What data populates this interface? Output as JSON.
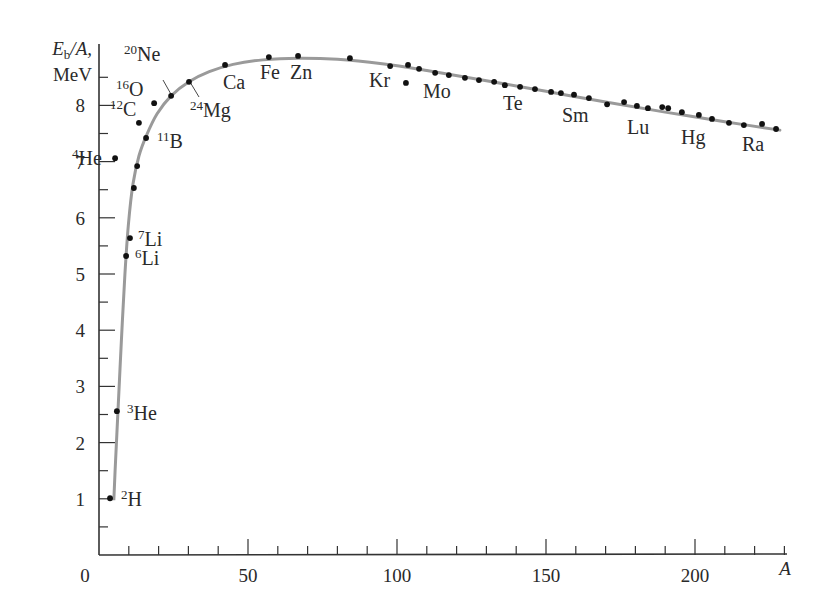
{
  "chart_data": {
    "type": "scatter",
    "title": "",
    "xlabel": "A",
    "ylabel_line1": "E_b/A,",
    "ylabel_line2": "MeV",
    "xlim": [
      0,
      230
    ],
    "ylim": [
      0,
      9.2
    ],
    "grid": false,
    "legend": null,
    "x_ticks": [
      0,
      50,
      100,
      150,
      200
    ],
    "x_tick_labels": [
      "0",
      "50",
      "100",
      "150",
      "200"
    ],
    "x_minor_step": 10,
    "y_ticks": [
      1,
      2,
      3,
      4,
      5,
      6,
      7,
      8
    ],
    "y_tick_labels": [
      "1",
      "2",
      "3",
      "4",
      "5",
      "6",
      "7",
      "8"
    ],
    "y_minor_step": 0.5,
    "colors": {
      "curve": "#9a9a9a",
      "points": "#111111",
      "axis": "#333333",
      "text": "#2a2a2a"
    },
    "series": [
      {
        "name": "Measured binding energy per nucleon",
        "kind": "points",
        "points": [
          {
            "A": 3.7,
            "E": 1.01
          },
          {
            "A": 6.0,
            "E": 2.56
          },
          {
            "A": 9.1,
            "E": 5.32
          },
          {
            "A": 10.4,
            "E": 5.64
          },
          {
            "A": 11.7,
            "E": 6.53
          },
          {
            "A": 12.8,
            "E": 6.92
          },
          {
            "A": 5.4,
            "E": 7.06
          },
          {
            "A": 15.8,
            "E": 7.42
          },
          {
            "A": 13.4,
            "E": 7.69
          },
          {
            "A": 18.5,
            "E": 8.04
          },
          {
            "A": 24.2,
            "E": 8.17
          },
          {
            "A": 30.2,
            "E": 8.42
          },
          {
            "A": 42.3,
            "E": 8.72
          },
          {
            "A": 57.0,
            "E": 8.86
          },
          {
            "A": 66.8,
            "E": 8.88
          },
          {
            "A": 84.2,
            "E": 8.84
          },
          {
            "A": 97.7,
            "E": 8.7
          },
          {
            "A": 103.0,
            "E": 8.4
          },
          {
            "A": 103.7,
            "E": 8.72
          },
          {
            "A": 107.4,
            "E": 8.65
          },
          {
            "A": 112.8,
            "E": 8.58
          },
          {
            "A": 117.4,
            "E": 8.54
          },
          {
            "A": 122.8,
            "E": 8.49
          },
          {
            "A": 127.5,
            "E": 8.45
          },
          {
            "A": 132.6,
            "E": 8.42
          },
          {
            "A": 136.2,
            "E": 8.36
          },
          {
            "A": 141.3,
            "E": 8.33
          },
          {
            "A": 146.3,
            "E": 8.29
          },
          {
            "A": 151.7,
            "E": 8.24
          },
          {
            "A": 155.0,
            "E": 8.22
          },
          {
            "A": 159.4,
            "E": 8.19
          },
          {
            "A": 164.4,
            "E": 8.13
          },
          {
            "A": 170.5,
            "E": 8.02
          },
          {
            "A": 176.2,
            "E": 8.06
          },
          {
            "A": 180.5,
            "E": 7.99
          },
          {
            "A": 184.2,
            "E": 7.95
          },
          {
            "A": 189.0,
            "E": 7.97
          },
          {
            "A": 191.0,
            "E": 7.95
          },
          {
            "A": 195.6,
            "E": 7.88
          },
          {
            "A": 201.3,
            "E": 7.83
          },
          {
            "A": 205.7,
            "E": 7.76
          },
          {
            "A": 211.4,
            "E": 7.69
          },
          {
            "A": 216.4,
            "E": 7.65
          },
          {
            "A": 222.5,
            "E": 7.67
          },
          {
            "A": 227.2,
            "E": 7.58
          }
        ]
      },
      {
        "name": "Semi-empirical fit",
        "kind": "curve",
        "points": [
          {
            "A": 5.0,
            "E": 1.0
          },
          {
            "A": 5.4,
            "E": 1.5
          },
          {
            "A": 6.4,
            "E": 2.6
          },
          {
            "A": 7.5,
            "E": 3.8
          },
          {
            "A": 8.7,
            "E": 5.0
          },
          {
            "A": 9.9,
            "E": 5.9
          },
          {
            "A": 11.4,
            "E": 6.6
          },
          {
            "A": 13.4,
            "E": 7.1
          },
          {
            "A": 15.8,
            "E": 7.45
          },
          {
            "A": 19.5,
            "E": 7.85
          },
          {
            "A": 24.2,
            "E": 8.17
          },
          {
            "A": 30.2,
            "E": 8.42
          },
          {
            "A": 37.0,
            "E": 8.6
          },
          {
            "A": 45.0,
            "E": 8.73
          },
          {
            "A": 55.0,
            "E": 8.81
          },
          {
            "A": 67.0,
            "E": 8.84
          },
          {
            "A": 80.0,
            "E": 8.82
          },
          {
            "A": 95.0,
            "E": 8.74
          },
          {
            "A": 110.0,
            "E": 8.62
          },
          {
            "A": 130.0,
            "E": 8.44
          },
          {
            "A": 150.0,
            "E": 8.25
          },
          {
            "A": 170.0,
            "E": 8.06
          },
          {
            "A": 190.0,
            "E": 7.88
          },
          {
            "A": 210.0,
            "E": 7.71
          },
          {
            "A": 228.5,
            "E": 7.56
          }
        ]
      }
    ],
    "annotations": [
      {
        "sup": "2",
        "sym": "H",
        "x": 121,
        "y": 506
      },
      {
        "sup": "3",
        "sym": "He",
        "x": 127,
        "y": 420
      },
      {
        "sup": "6",
        "sym": "Li",
        "x": 135,
        "y": 265
      },
      {
        "sup": "7",
        "sym": "Li",
        "x": 138,
        "y": 246
      },
      {
        "sup": "4",
        "sym": "He",
        "x": 72,
        "y": 165
      },
      {
        "sup": "11",
        "sym": "B",
        "x": 157,
        "y": 148
      },
      {
        "sup": "12",
        "sym": "C",
        "x": 110,
        "y": 116
      },
      {
        "sup": "16",
        "sym": "O",
        "x": 116,
        "y": 96
      },
      {
        "sup": "20",
        "sym": "Ne",
        "x": 124,
        "y": 61
      },
      {
        "sup": "24",
        "sym": "Mg",
        "x": 190,
        "y": 117
      },
      {
        "sup": "",
        "sym": "Ca",
        "x": 223,
        "y": 89
      },
      {
        "sup": "",
        "sym": "Fe",
        "x": 260,
        "y": 79
      },
      {
        "sup": "",
        "sym": "Zn",
        "x": 290,
        "y": 79
      },
      {
        "sup": "",
        "sym": "Kr",
        "x": 369,
        "y": 87
      },
      {
        "sup": "",
        "sym": "Mo",
        "x": 423,
        "y": 98
      },
      {
        "sup": "",
        "sym": "Te",
        "x": 503,
        "y": 110
      },
      {
        "sup": "",
        "sym": "Sm",
        "x": 562,
        "y": 122
      },
      {
        "sup": "",
        "sym": "Lu",
        "x": 627,
        "y": 134
      },
      {
        "sup": "",
        "sym": "Hg",
        "x": 681,
        "y": 144
      },
      {
        "sup": "",
        "sym": "Ra",
        "x": 742,
        "y": 151
      }
    ],
    "leader_lines": [
      {
        "label": "20Ne",
        "x1": 163,
        "y1": 80,
        "x2": 172,
        "y2": 96
      },
      {
        "label": "24Mg",
        "x1": 190,
        "y1": 82,
        "x2": 199,
        "y2": 97
      }
    ]
  }
}
